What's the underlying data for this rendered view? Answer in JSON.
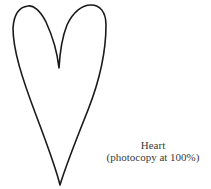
{
  "figure": {
    "shape": "heart-outline",
    "stroke_color": "#1a1a1a",
    "background": "#ffffff"
  },
  "caption": {
    "title": "Heart",
    "subtitle": "(photocopy at 100%)"
  }
}
